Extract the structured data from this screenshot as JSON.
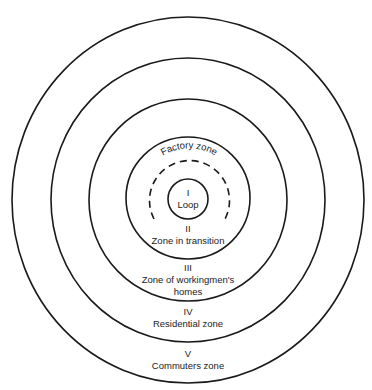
{
  "diagram": {
    "zones": [
      {
        "numeral": "I",
        "label": "Loop"
      },
      {
        "numeral": "II",
        "label": "Zone in transition"
      },
      {
        "numeral": "III",
        "label_line1": "Zone of workingmen's",
        "label_line2": "homes"
      },
      {
        "numeral": "IV",
        "label": "Residential zone"
      },
      {
        "numeral": "V",
        "label": "Commuters zone"
      }
    ],
    "arc_label": "Factory zone",
    "colors": {
      "stroke": "#1a1a1a",
      "background": "#ffffff"
    }
  }
}
